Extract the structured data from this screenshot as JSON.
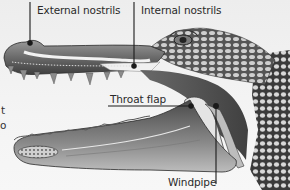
{
  "diagram": {
    "colors": {
      "background": "#f2f2f2",
      "label_text": "#2a2a2a",
      "leader_line": "#1a1a1a"
    },
    "labels": [
      {
        "id": "external-nostrils",
        "text": "External nostrils"
      },
      {
        "id": "internal-nostrils",
        "text": "Internal nostrils"
      },
      {
        "id": "throat-flap",
        "text": "Throat flap"
      },
      {
        "id": "windpipe",
        "text": "Windpipe"
      }
    ],
    "cropped_text_fragments": [
      "t",
      "o"
    ]
  }
}
